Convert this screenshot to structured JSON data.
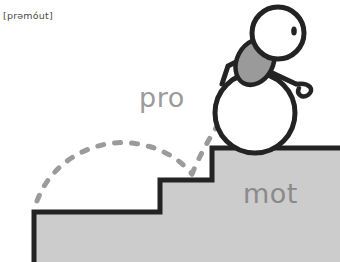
{
  "illustration": {
    "title": "promote-mnemonic-illustration",
    "phonetic": "[prəmóut]",
    "labels": {
      "prefix": "pro",
      "root": "mot"
    },
    "icons": {
      "figure": "stick-figure-icon",
      "ball": "large-ball-icon",
      "head": "head-circle-icon",
      "eye": "eye-dot-icon",
      "torso": "torso-oval-icon",
      "arm": "arm-line-icon",
      "leg": "leg-line-icon",
      "foot": "foot-curl-icon",
      "trajectory": "dashed-bounce-arc-icon",
      "stairs": "staircase-shape-icon"
    },
    "colors": {
      "outline": "#1f1f1f",
      "step_fill": "#cccccc",
      "torso_fill": "#9a9a9a",
      "ball_fill": "#ffffff",
      "head_fill": "#ffffff",
      "dash": "#9b9b9b",
      "label_pro": "#9b9b9b",
      "label_mot": "#8a8a8a",
      "phonetic": "#4a4a4a",
      "background": "#ffffff"
    }
  }
}
